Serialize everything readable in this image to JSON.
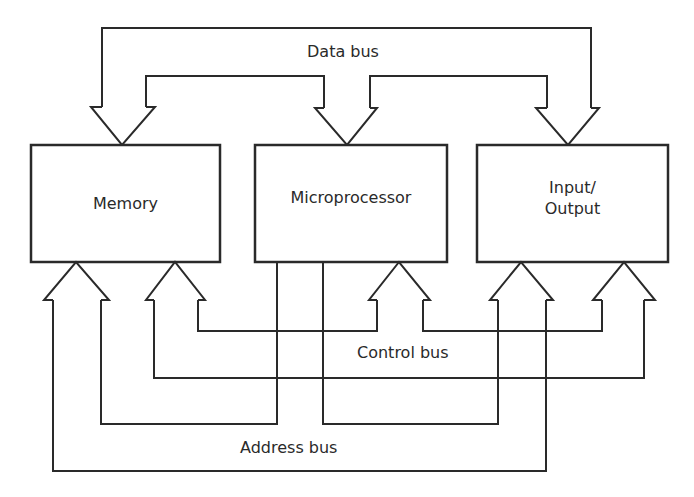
{
  "diagram": {
    "blocks": [
      {
        "id": "memory",
        "label": "Memory",
        "x": 31,
        "y": 145,
        "w": 189,
        "h": 117
      },
      {
        "id": "microprocessor",
        "label": "Microprocessor",
        "x": 255,
        "y": 145,
        "w": 192,
        "h": 117
      },
      {
        "id": "io",
        "label_line1": "Input/",
        "label_line2": "Output",
        "x": 477,
        "y": 145,
        "w": 191,
        "h": 117
      }
    ],
    "buses": {
      "data": {
        "label": "Data bus",
        "direction": "down",
        "targets": [
          "memory",
          "microprocessor",
          "io"
        ]
      },
      "control": {
        "label": "Control bus",
        "direction": "up",
        "targets": [
          "memory",
          "microprocessor",
          "io"
        ]
      },
      "address": {
        "label": "Address bus",
        "direction": "up",
        "source": "microprocessor",
        "targets": [
          "memory",
          "io"
        ]
      }
    },
    "stroke_color": "#2a2a2a",
    "background": "#ffffff"
  }
}
